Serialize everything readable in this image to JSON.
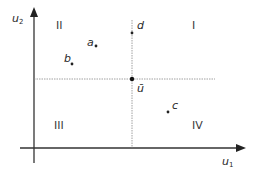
{
  "diagram": {
    "axes": {
      "x_label": "u",
      "x_sub": "1",
      "y_label": "u",
      "y_sub": "2"
    },
    "quadrants": {
      "q1": "I",
      "q2": "II",
      "q3": "III",
      "q4": "IV"
    },
    "points": {
      "a": "a",
      "b": "b",
      "c": "c",
      "d": "d",
      "ubar": "ū"
    },
    "colors": {
      "axis": "#333333",
      "guide": "#888888",
      "point": "#222222"
    }
  }
}
